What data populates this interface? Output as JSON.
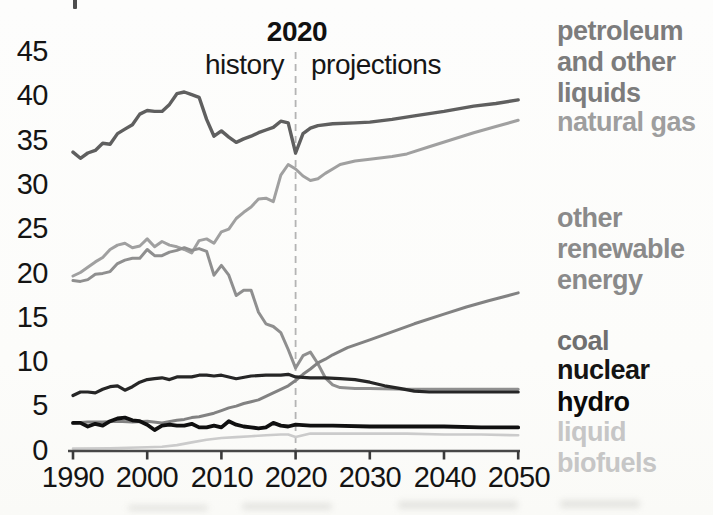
{
  "chart_data": {
    "type": "line",
    "title": "2020",
    "annotations": {
      "divider_year_label": "2020",
      "left_label": "history",
      "right_label": "projections"
    },
    "x_axis": {
      "ticks": [
        "1990",
        "2000",
        "2010",
        "2020",
        "2030",
        "2040",
        "2050"
      ],
      "range": [
        1990,
        2050
      ]
    },
    "y_axis": {
      "ticks": [
        "45",
        "40",
        "35",
        "30",
        "25",
        "20",
        "15",
        "10",
        "5",
        "0"
      ],
      "range": [
        0,
        45
      ]
    },
    "divider": {
      "year": 2020,
      "color": "#b4b4b4"
    },
    "axis_color": "#474747",
    "text_color": "#141414",
    "legend_position": "right",
    "grid": false,
    "series": [
      {
        "name": "petroleum-and-other-liquids",
        "label": "petroleum and other liquids",
        "label_lines": [
          "petroleum",
          "and other",
          "liquids"
        ],
        "color": "#5f5f5f",
        "label_color": "#7c7c7c",
        "line_width": 3.4,
        "z": 5,
        "points": [
          [
            1990,
            33.6
          ],
          [
            1991,
            32.9
          ],
          [
            1992,
            33.5
          ],
          [
            1993,
            33.8
          ],
          [
            1994,
            34.6
          ],
          [
            1995,
            34.5
          ],
          [
            1996,
            35.7
          ],
          [
            1997,
            36.2
          ],
          [
            1998,
            36.7
          ],
          [
            1999,
            37.9
          ],
          [
            2000,
            38.3
          ],
          [
            2001,
            38.2
          ],
          [
            2002,
            38.2
          ],
          [
            2003,
            39.0
          ],
          [
            2004,
            40.2
          ],
          [
            2005,
            40.4
          ],
          [
            2006,
            40.1
          ],
          [
            2007,
            39.8
          ],
          [
            2008,
            37.3
          ],
          [
            2009,
            35.4
          ],
          [
            2010,
            36.0
          ],
          [
            2011,
            35.3
          ],
          [
            2012,
            34.7
          ],
          [
            2013,
            35.1
          ],
          [
            2014,
            35.4
          ],
          [
            2015,
            35.8
          ],
          [
            2016,
            36.1
          ],
          [
            2017,
            36.4
          ],
          [
            2018,
            37.1
          ],
          [
            2019,
            36.9
          ],
          [
            2020,
            33.5
          ],
          [
            2021,
            35.7
          ],
          [
            2022,
            36.3
          ],
          [
            2023,
            36.6
          ],
          [
            2025,
            36.8
          ],
          [
            2028,
            36.9
          ],
          [
            2030,
            37.0
          ],
          [
            2033,
            37.3
          ],
          [
            2036,
            37.7
          ],
          [
            2040,
            38.2
          ],
          [
            2044,
            38.8
          ],
          [
            2047,
            39.1
          ],
          [
            2050,
            39.5
          ]
        ]
      },
      {
        "name": "natural-gas",
        "label": "natural gas",
        "label_lines": [
          "natural gas"
        ],
        "color": "#a0a0a0",
        "label_color": "#9e9e9e",
        "line_width": 3,
        "z": 2,
        "points": [
          [
            1990,
            19.6
          ],
          [
            1991,
            20.0
          ],
          [
            1992,
            20.6
          ],
          [
            1993,
            21.2
          ],
          [
            1994,
            21.7
          ],
          [
            1995,
            22.6
          ],
          [
            1996,
            23.1
          ],
          [
            1997,
            23.3
          ],
          [
            1998,
            22.8
          ],
          [
            1999,
            23.0
          ],
          [
            2000,
            23.8
          ],
          [
            2001,
            22.9
          ],
          [
            2002,
            23.5
          ],
          [
            2003,
            23.1
          ],
          [
            2004,
            22.9
          ],
          [
            2005,
            22.6
          ],
          [
            2006,
            22.2
          ],
          [
            2007,
            23.6
          ],
          [
            2008,
            23.8
          ],
          [
            2009,
            23.3
          ],
          [
            2010,
            24.6
          ],
          [
            2011,
            24.9
          ],
          [
            2012,
            26.1
          ],
          [
            2013,
            26.8
          ],
          [
            2014,
            27.4
          ],
          [
            2015,
            28.3
          ],
          [
            2016,
            28.4
          ],
          [
            2017,
            28.0
          ],
          [
            2018,
            31.0
          ],
          [
            2019,
            32.2
          ],
          [
            2020,
            31.7
          ],
          [
            2021,
            30.9
          ],
          [
            2022,
            30.4
          ],
          [
            2023,
            30.6
          ],
          [
            2024,
            31.2
          ],
          [
            2025,
            31.7
          ],
          [
            2026,
            32.2
          ],
          [
            2028,
            32.6
          ],
          [
            2030,
            32.8
          ],
          [
            2033,
            33.1
          ],
          [
            2035,
            33.4
          ],
          [
            2038,
            34.2
          ],
          [
            2041,
            35.0
          ],
          [
            2044,
            35.8
          ],
          [
            2047,
            36.5
          ],
          [
            2050,
            37.2
          ]
        ]
      },
      {
        "name": "other-renewable-energy",
        "label": "other renewable energy",
        "label_lines": [
          "other",
          "renewable",
          "energy"
        ],
        "color": "#828282",
        "label_color": "#8a8a8a",
        "line_width": 3,
        "z": 4,
        "points": [
          [
            1990,
            3.0
          ],
          [
            1992,
            3.1
          ],
          [
            1994,
            3.1
          ],
          [
            1996,
            3.2
          ],
          [
            1998,
            3.1
          ],
          [
            2000,
            3.2
          ],
          [
            2002,
            3.0
          ],
          [
            2004,
            3.3
          ],
          [
            2005,
            3.4
          ],
          [
            2006,
            3.6
          ],
          [
            2007,
            3.7
          ],
          [
            2008,
            3.9
          ],
          [
            2009,
            4.1
          ],
          [
            2010,
            4.4
          ],
          [
            2011,
            4.7
          ],
          [
            2012,
            4.9
          ],
          [
            2013,
            5.2
          ],
          [
            2014,
            5.4
          ],
          [
            2015,
            5.6
          ],
          [
            2016,
            6.0
          ],
          [
            2017,
            6.4
          ],
          [
            2018,
            6.8
          ],
          [
            2019,
            7.2
          ],
          [
            2020,
            7.8
          ],
          [
            2021,
            8.5
          ],
          [
            2022,
            9.1
          ],
          [
            2023,
            9.8
          ],
          [
            2024,
            10.2
          ],
          [
            2025,
            10.7
          ],
          [
            2027,
            11.5
          ],
          [
            2030,
            12.4
          ],
          [
            2033,
            13.3
          ],
          [
            2036,
            14.2
          ],
          [
            2040,
            15.3
          ],
          [
            2043,
            16.1
          ],
          [
            2046,
            16.8
          ],
          [
            2050,
            17.7
          ]
        ]
      },
      {
        "name": "coal",
        "label": "coal",
        "label_lines": [
          "coal"
        ],
        "color": "#8f8f8f",
        "label_color": "#6f6f6f",
        "line_width": 3,
        "z": 3,
        "points": [
          [
            1990,
            19.1
          ],
          [
            1991,
            19.0
          ],
          [
            1992,
            19.2
          ],
          [
            1993,
            19.8
          ],
          [
            1994,
            19.9
          ],
          [
            1995,
            20.1
          ],
          [
            1996,
            21.0
          ],
          [
            1997,
            21.4
          ],
          [
            1998,
            21.6
          ],
          [
            1999,
            21.6
          ],
          [
            2000,
            22.6
          ],
          [
            2001,
            21.9
          ],
          [
            2002,
            21.9
          ],
          [
            2003,
            22.3
          ],
          [
            2004,
            22.5
          ],
          [
            2005,
            22.8
          ],
          [
            2006,
            22.5
          ],
          [
            2007,
            22.7
          ],
          [
            2008,
            22.4
          ],
          [
            2009,
            19.7
          ],
          [
            2010,
            20.8
          ],
          [
            2011,
            19.7
          ],
          [
            2012,
            17.4
          ],
          [
            2013,
            18.0
          ],
          [
            2014,
            18.0
          ],
          [
            2015,
            15.5
          ],
          [
            2016,
            14.2
          ],
          [
            2017,
            13.9
          ],
          [
            2018,
            13.2
          ],
          [
            2019,
            11.3
          ],
          [
            2020,
            9.2
          ],
          [
            2021,
            10.6
          ],
          [
            2022,
            11.0
          ],
          [
            2023,
            9.7
          ],
          [
            2024,
            8.1
          ],
          [
            2025,
            7.3
          ],
          [
            2026,
            7.0
          ],
          [
            2028,
            6.9
          ],
          [
            2030,
            6.9
          ],
          [
            2035,
            6.8
          ],
          [
            2040,
            6.8
          ],
          [
            2045,
            6.8
          ],
          [
            2050,
            6.8
          ]
        ]
      },
      {
        "name": "nuclear",
        "label": "nuclear",
        "label_lines": [
          "nuclear"
        ],
        "color": "#262626",
        "label_color": "#141414",
        "line_width": 3.2,
        "z": 6,
        "points": [
          [
            1990,
            6.1
          ],
          [
            1991,
            6.5
          ],
          [
            1992,
            6.5
          ],
          [
            1993,
            6.4
          ],
          [
            1994,
            6.8
          ],
          [
            1995,
            7.1
          ],
          [
            1996,
            7.2
          ],
          [
            1997,
            6.7
          ],
          [
            1998,
            7.1
          ],
          [
            1999,
            7.6
          ],
          [
            2000,
            7.9
          ],
          [
            2001,
            8.0
          ],
          [
            2002,
            8.1
          ],
          [
            2003,
            7.9
          ],
          [
            2004,
            8.2
          ],
          [
            2005,
            8.2
          ],
          [
            2006,
            8.2
          ],
          [
            2007,
            8.4
          ],
          [
            2008,
            8.4
          ],
          [
            2009,
            8.3
          ],
          [
            2010,
            8.4
          ],
          [
            2012,
            8.0
          ],
          [
            2014,
            8.3
          ],
          [
            2016,
            8.4
          ],
          [
            2018,
            8.4
          ],
          [
            2019,
            8.5
          ],
          [
            2020,
            8.2
          ],
          [
            2022,
            8.1
          ],
          [
            2024,
            8.1
          ],
          [
            2026,
            8.0
          ],
          [
            2028,
            7.9
          ],
          [
            2030,
            7.6
          ],
          [
            2032,
            7.2
          ],
          [
            2034,
            6.9
          ],
          [
            2036,
            6.6
          ],
          [
            2038,
            6.5
          ],
          [
            2040,
            6.5
          ],
          [
            2045,
            6.5
          ],
          [
            2050,
            6.5
          ]
        ]
      },
      {
        "name": "hydro",
        "label": "hydro",
        "label_lines": [
          "hydro"
        ],
        "color": "#101010",
        "label_color": "#0a0a0a",
        "line_width": 3.8,
        "z": 7,
        "points": [
          [
            1990,
            3.0
          ],
          [
            1991,
            3.0
          ],
          [
            1992,
            2.6
          ],
          [
            1993,
            2.9
          ],
          [
            1994,
            2.7
          ],
          [
            1995,
            3.2
          ],
          [
            1996,
            3.5
          ],
          [
            1997,
            3.6
          ],
          [
            1998,
            3.3
          ],
          [
            1999,
            3.2
          ],
          [
            2000,
            2.8
          ],
          [
            2001,
            2.2
          ],
          [
            2002,
            2.7
          ],
          [
            2003,
            2.8
          ],
          [
            2004,
            2.7
          ],
          [
            2005,
            2.7
          ],
          [
            2006,
            2.9
          ],
          [
            2007,
            2.5
          ],
          [
            2008,
            2.5
          ],
          [
            2009,
            2.7
          ],
          [
            2010,
            2.5
          ],
          [
            2011,
            3.2
          ],
          [
            2012,
            2.8
          ],
          [
            2013,
            2.6
          ],
          [
            2014,
            2.5
          ],
          [
            2015,
            2.4
          ],
          [
            2016,
            2.5
          ],
          [
            2017,
            3.0
          ],
          [
            2018,
            2.7
          ],
          [
            2019,
            2.6
          ],
          [
            2020,
            2.8
          ],
          [
            2022,
            2.7
          ],
          [
            2025,
            2.7
          ],
          [
            2030,
            2.6
          ],
          [
            2035,
            2.6
          ],
          [
            2040,
            2.6
          ],
          [
            2045,
            2.5
          ],
          [
            2050,
            2.5
          ]
        ]
      },
      {
        "name": "liquid-biofuels",
        "label": "liquid biofuels",
        "label_lines": [
          "liquid",
          "biofuels"
        ],
        "color": "#cbcbcb",
        "label_color": "#c6c6c6",
        "line_width": 2.6,
        "z": 1,
        "points": [
          [
            1990,
            0.1
          ],
          [
            1995,
            0.15
          ],
          [
            2000,
            0.25
          ],
          [
            2002,
            0.3
          ],
          [
            2004,
            0.5
          ],
          [
            2006,
            0.8
          ],
          [
            2008,
            1.1
          ],
          [
            2010,
            1.3
          ],
          [
            2012,
            1.4
          ],
          [
            2014,
            1.5
          ],
          [
            2016,
            1.6
          ],
          [
            2018,
            1.7
          ],
          [
            2019,
            1.7
          ],
          [
            2020,
            1.4
          ],
          [
            2021,
            1.6
          ],
          [
            2022,
            1.8
          ],
          [
            2025,
            1.8
          ],
          [
            2030,
            1.8
          ],
          [
            2035,
            1.8
          ],
          [
            2040,
            1.7
          ],
          [
            2045,
            1.7
          ],
          [
            2050,
            1.6
          ]
        ]
      }
    ]
  }
}
